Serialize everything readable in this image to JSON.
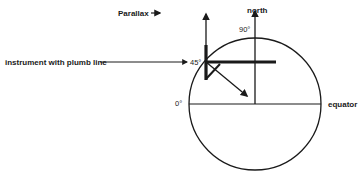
{
  "diagram": {
    "labels": {
      "parallax": "Parallax",
      "north": "north",
      "deg90": "90°",
      "deg45": "45°",
      "deg0": "0°",
      "equator": "equator",
      "instrument": "instrument with plumb line"
    },
    "colors": {
      "stroke": "#1a1a1a",
      "background": "#ffffff"
    }
  }
}
